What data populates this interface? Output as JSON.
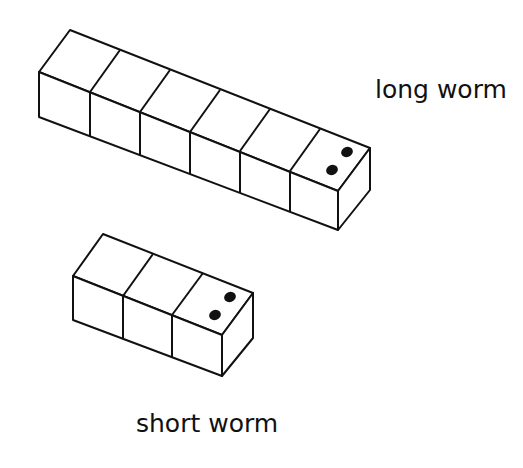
{
  "diagram": {
    "type": "isometric-cube-worms",
    "colors": {
      "stroke": "#111111",
      "fill": "#ffffff",
      "eyes": "#111111"
    },
    "worms": [
      {
        "name": "long worm",
        "label": "long worm",
        "cube_count": 6,
        "has_eyes": true,
        "eyes_count": 2
      },
      {
        "name": "short worm",
        "label": "short worm",
        "cube_count": 3,
        "has_eyes": true,
        "eyes_count": 2
      }
    ]
  }
}
